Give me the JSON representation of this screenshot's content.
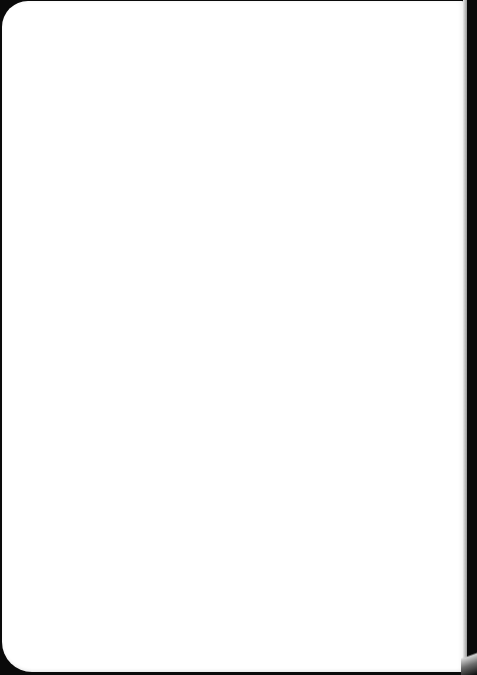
{
  "document": {
    "type": "blank-page",
    "content": ""
  },
  "colors": {
    "page": "#ffffff",
    "background": "#0a0a0a"
  }
}
